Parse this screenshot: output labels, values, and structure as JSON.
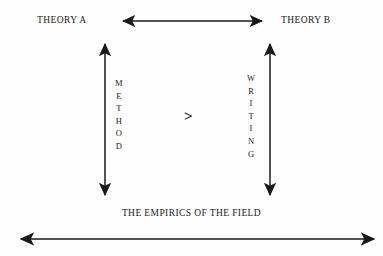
{
  "diagram": {
    "title_top_left": "THEORY A",
    "title_top_right": "THEORY B",
    "center_relation": ">",
    "bottom_caption": "THE EMPIRICS OF THE FIELD",
    "left_axis_label": "METHOD",
    "right_axis_label": "WRITING",
    "colors": {
      "background": "#fefefe",
      "ink": "#202020",
      "arrow": "#1a1a1a"
    },
    "arrows": [
      {
        "name": "theory-a-to-theory-b-arrow",
        "orientation": "horizontal",
        "heads": "both",
        "from": [
          123,
          21
        ],
        "to": [
          262,
          21
        ]
      },
      {
        "name": "theory-a-to-empirics-arrow",
        "orientation": "vertical",
        "heads": "both",
        "from": [
          105,
          43
        ],
        "to": [
          105,
          196
        ]
      },
      {
        "name": "theory-b-to-empirics-arrow",
        "orientation": "vertical",
        "heads": "both",
        "from": [
          270,
          43
        ],
        "to": [
          270,
          196
        ]
      },
      {
        "name": "empirics-of-the-field-arrow",
        "orientation": "horizontal",
        "heads": "both",
        "from": [
          20,
          239
        ],
        "to": [
          375,
          239
        ]
      }
    ]
  }
}
